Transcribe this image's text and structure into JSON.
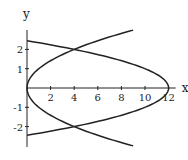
{
  "chart_data": {
    "type": "line",
    "title": "",
    "xlabel": "x",
    "ylabel": "y",
    "xlim": [
      0,
      12.6
    ],
    "ylim": [
      -3,
      3
    ],
    "grid": false,
    "legend": null,
    "x_ticks": [
      2,
      4,
      6,
      8,
      10,
      12
    ],
    "x_tick_labels": [
      "2",
      "4",
      "6",
      "8",
      "10",
      "12"
    ],
    "y_ticks": [
      2,
      1,
      -1,
      -2
    ],
    "y_tick_labels": [
      "2",
      "1",
      "-1",
      "-2"
    ],
    "series": [
      {
        "name": "x = y^2",
        "parametric": "x = y^2",
        "y_range": [
          -3,
          3
        ],
        "points": [
          [
            9,
            -3
          ],
          [
            4,
            -2
          ],
          [
            1,
            -1
          ],
          [
            0,
            0
          ],
          [
            1,
            1
          ],
          [
            4,
            2
          ],
          [
            9,
            3
          ]
        ]
      },
      {
        "name": "x = 12 - 2y^2",
        "parametric": "x = 12 - 2*y^2",
        "y_range": [
          -2.449,
          2.449
        ],
        "points": [
          [
            0,
            -2.449
          ],
          [
            4,
            -2
          ],
          [
            10,
            -1
          ],
          [
            12,
            0
          ],
          [
            10,
            1
          ],
          [
            4,
            2
          ],
          [
            0,
            2.449
          ]
        ]
      }
    ],
    "intersections": [
      [
        4,
        2
      ],
      [
        4,
        -2
      ]
    ]
  },
  "layout": {
    "origin_px": [
      27,
      88
    ],
    "x_unit_px": 11.8,
    "y_unit_px": 19.3,
    "line_color": "#222222"
  }
}
